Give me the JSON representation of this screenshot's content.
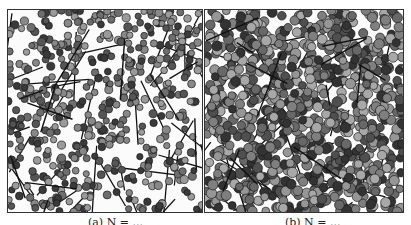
{
  "figure": {
    "panels": [
      {
        "id": "a",
        "caption": "(a) N = ...",
        "circle_count": 520,
        "line_count": 38,
        "circle_radius": 3.6,
        "fill_shades": [
          "#3a3a3a",
          "#555555",
          "#6e6e6e",
          "#888888",
          "#9a9a9a"
        ],
        "line_color": "#111111"
      },
      {
        "id": "b",
        "caption": "(b) N = ...",
        "circle_count": 900,
        "line_count": 40,
        "circle_radius": 4.6,
        "fill_shades": [
          "#333333",
          "#4f4f4f",
          "#686868",
          "#7f7f7f",
          "#969696",
          "#a8a8a8"
        ],
        "line_color": "#111111"
      }
    ],
    "border_color": "#333333",
    "background_color": "#fbfbfb"
  }
}
